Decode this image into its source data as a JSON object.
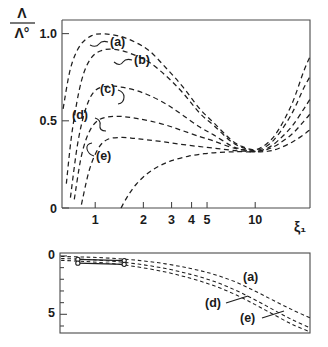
{
  "figure": {
    "name": "two-panel-scientific-plot",
    "background": "#ffffff",
    "ink_color": "#1f1f1f"
  },
  "chart_data": [
    {
      "type": "line",
      "panel": "top",
      "title": "",
      "xlabel": "ξ₁",
      "ylabel": "Λ/Λ°",
      "ylabel_numerator": "Λ",
      "ylabel_denominator": "Λ°",
      "xscale": "log",
      "xlim": [
        0.62,
        22
      ],
      "ylim": [
        0,
        1.08
      ],
      "xticks": [
        1,
        2,
        3,
        4,
        5,
        10
      ],
      "xtick_labels": [
        "1",
        "2",
        "3",
        "4",
        "5",
        "10"
      ],
      "yticks": [
        0,
        0.5,
        1.0
      ],
      "ytick_labels": [
        "0",
        "0.5",
        "1.0"
      ],
      "grid": false,
      "legend": "inline-labels",
      "linestyle": "dashed",
      "annotations": [
        "(a)",
        "(b)",
        "(c)",
        "(d)",
        "(e)"
      ],
      "series": [
        {
          "name": "(a)",
          "label": "(a)",
          "x": [
            0.63,
            0.7,
            0.8,
            0.95,
            1.15,
            1.45,
            1.8,
            2.2,
            2.8,
            3.5,
            4.5,
            5.5,
            7.0,
            8.2,
            10.0,
            12.0,
            14.0,
            17.0,
            20.0,
            22.0
          ],
          "values": [
            0.57,
            0.8,
            0.93,
            0.99,
            1.0,
            0.985,
            0.95,
            0.9,
            0.8,
            0.7,
            0.57,
            0.49,
            0.395,
            0.355,
            0.335,
            0.375,
            0.45,
            0.6,
            0.78,
            0.87
          ]
        },
        {
          "name": "(b)",
          "label": "(b)",
          "x": [
            0.66,
            0.72,
            0.82,
            0.95,
            1.15,
            1.45,
            1.8,
            2.2,
            2.8,
            3.5,
            4.5,
            5.5,
            7.0,
            8.2,
            10.0,
            12.0,
            14.0,
            17.0,
            20.0,
            22.0
          ],
          "values": [
            0.14,
            0.45,
            0.73,
            0.865,
            0.91,
            0.905,
            0.875,
            0.835,
            0.755,
            0.665,
            0.545,
            0.475,
            0.385,
            0.35,
            0.33,
            0.36,
            0.425,
            0.545,
            0.685,
            0.755
          ]
        },
        {
          "name": "(c)",
          "label": "(c)",
          "x": [
            0.7,
            0.78,
            0.88,
            1.0,
            1.2,
            1.45,
            1.8,
            2.2,
            2.8,
            3.5,
            4.5,
            5.5,
            7.0,
            8.2,
            10.0,
            12.0,
            14.0,
            17.0,
            20.0,
            22.0
          ],
          "values": [
            0.06,
            0.38,
            0.58,
            0.675,
            0.7,
            0.695,
            0.675,
            0.645,
            0.595,
            0.535,
            0.465,
            0.42,
            0.36,
            0.338,
            0.325,
            0.345,
            0.39,
            0.47,
            0.565,
            0.625
          ]
        },
        {
          "name": "(d)",
          "label": "(d)",
          "x": [
            0.74,
            0.82,
            0.92,
            1.05,
            1.25,
            1.5,
            1.8,
            2.2,
            2.8,
            3.5,
            4.5,
            5.5,
            7.0,
            8.2,
            10.0,
            12.0,
            14.0,
            17.0,
            20.0,
            22.0
          ],
          "values": [
            0.05,
            0.3,
            0.44,
            0.505,
            0.525,
            0.525,
            0.515,
            0.5,
            0.475,
            0.445,
            0.41,
            0.385,
            0.35,
            0.335,
            0.325,
            0.338,
            0.368,
            0.425,
            0.495,
            0.54
          ]
        },
        {
          "name": "(e)",
          "label": "(e)",
          "x": [
            0.82,
            0.92,
            1.05,
            1.2,
            1.45,
            1.75,
            2.1,
            2.6,
            3.2,
            4.0,
            5.0,
            6.2,
            7.5,
            8.6,
            10.0,
            12.0,
            14.0,
            17.0,
            20.0,
            22.0
          ],
          "values": [
            0.02,
            0.22,
            0.345,
            0.395,
            0.405,
            0.4,
            0.392,
            0.382,
            0.37,
            0.358,
            0.348,
            0.338,
            0.33,
            0.326,
            0.322,
            0.326,
            0.342,
            0.378,
            0.42,
            0.45
          ]
        },
        {
          "name": "rising-lowest",
          "label": "",
          "x": [
            1.45,
            1.6,
            1.8,
            2.1,
            2.5,
            3.0,
            3.8,
            4.8,
            6.0,
            7.5,
            9.0,
            10.0
          ],
          "values": [
            0.0,
            0.07,
            0.135,
            0.195,
            0.24,
            0.272,
            0.297,
            0.312,
            0.32,
            0.323,
            0.323,
            0.322
          ]
        }
      ]
    },
    {
      "type": "line",
      "panel": "bottom",
      "title": "",
      "xlabel": "",
      "ylabel": "",
      "xscale": "log",
      "xlim": [
        0.62,
        22
      ],
      "ylim": [
        6.6,
        -0.25
      ],
      "y_inverted": true,
      "yticks": [
        0,
        1,
        2,
        3,
        4,
        5,
        6
      ],
      "ytick_labels": [
        "0",
        "",
        "",
        "",
        "",
        "5",
        ""
      ],
      "labeled_yticks": [
        "0",
        "5"
      ],
      "grid": false,
      "linestyle": "dashed",
      "annotations": [
        "(a)",
        "(d)",
        "(e)"
      ],
      "series": [
        {
          "name": "(a)",
          "label": "(a)",
          "x": [
            0.63,
            0.9,
            1.3,
            1.9,
            2.8,
            4.0,
            5.5,
            7.5,
            10.0,
            13.0,
            17.0,
            22.0
          ],
          "values": [
            0.05,
            0.1,
            0.2,
            0.38,
            0.68,
            1.08,
            1.55,
            2.2,
            3.0,
            3.8,
            4.6,
            5.3
          ]
        },
        {
          "name": "(d)",
          "label": "(d)",
          "x": [
            0.63,
            0.9,
            1.3,
            1.9,
            2.8,
            4.0,
            5.5,
            7.5,
            10.0,
            13.0,
            17.0,
            22.0
          ],
          "values": [
            0.22,
            0.3,
            0.45,
            0.7,
            1.08,
            1.58,
            2.15,
            2.9,
            3.75,
            4.6,
            5.45,
            6.15
          ]
        },
        {
          "name": "(e)",
          "label": "(e)",
          "x": [
            0.63,
            0.9,
            1.3,
            1.9,
            2.8,
            4.0,
            5.5,
            7.5,
            10.0,
            13.0,
            17.0,
            22.0
          ],
          "values": [
            0.38,
            0.48,
            0.65,
            0.95,
            1.38,
            1.92,
            2.52,
            3.28,
            4.15,
            5.0,
            5.85,
            6.5
          ]
        }
      ],
      "marker_segments": [
        {
          "name": "upper-marker-segment",
          "x": [
            0.8,
            1.55
          ],
          "values": [
            0.3,
            0.4
          ],
          "marker": "open-circle"
        },
        {
          "name": "lower-marker-segment",
          "x": [
            0.8,
            1.55
          ],
          "values": [
            0.62,
            0.72
          ],
          "marker": "open-circle"
        }
      ]
    }
  ]
}
